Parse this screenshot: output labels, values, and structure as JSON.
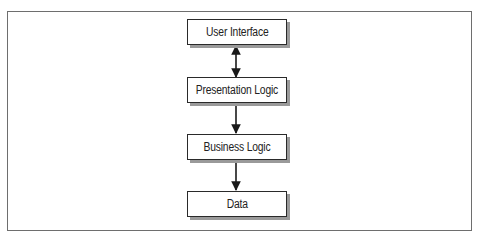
{
  "diagram": {
    "type": "layered-architecture",
    "nodes": [
      {
        "id": "ui",
        "label": "User Interface"
      },
      {
        "id": "presentation",
        "label": "Presentation Logic"
      },
      {
        "id": "business",
        "label": "Business Logic"
      },
      {
        "id": "data",
        "label": "Data"
      }
    ],
    "edges": [
      {
        "from": "ui",
        "to": "presentation",
        "direction": "bidirectional"
      },
      {
        "from": "presentation",
        "to": "business",
        "direction": "forward"
      },
      {
        "from": "business",
        "to": "data",
        "direction": "forward"
      }
    ],
    "colors": {
      "border": "#2a2a2a",
      "shadow": "#9a9a9a",
      "frame": "#6e6e6e",
      "text": "#222222"
    }
  }
}
